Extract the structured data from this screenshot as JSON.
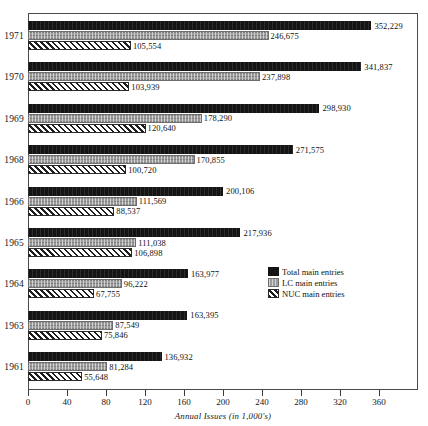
{
  "chart_data": {
    "type": "bar",
    "orientation": "horizontal",
    "title": "",
    "xlabel": "Annual Issues (in 1,000's)",
    "ylabel": "",
    "xlim": [
      0,
      400
    ],
    "xticks": [
      0,
      40,
      80,
      120,
      160,
      200,
      240,
      280,
      320,
      360
    ],
    "xtick_labels": [
      "0",
      "40",
      "80",
      "120",
      "160",
      "200",
      "240",
      "280",
      "320",
      "360"
    ],
    "grid": false,
    "legend_position": "inside-right",
    "units_note": "values plotted in 1,000's; data labels show full counts",
    "categories": [
      "1971",
      "1970",
      "1969",
      "1968",
      "1966",
      "1965",
      "1964",
      "1963",
      "1961"
    ],
    "series": [
      {
        "name": "Total main entries",
        "key": "total",
        "color": "#141414",
        "pattern": "solid-black",
        "values": [
          352229,
          341837,
          298930,
          271575,
          200106,
          217936,
          163977,
          163395,
          136932
        ],
        "labels": [
          "352,229",
          "341,837",
          "298,930",
          "271,575",
          "200,106",
          "217,936",
          "163,977",
          "163,395",
          "136,932"
        ]
      },
      {
        "name": "LC main entries",
        "key": "lc",
        "color": "#9c9c9c",
        "pattern": "gray-stipple",
        "values": [
          246675,
          237898,
          178290,
          170855,
          111569,
          111038,
          96222,
          87549,
          81284
        ],
        "labels": [
          "246,675",
          "237,898",
          "178,290",
          "170,855",
          "111,569",
          "111,038",
          "96,222",
          "87,549",
          "81,284"
        ]
      },
      {
        "name": "NUC main entries",
        "key": "nuc",
        "color": "#ffffff",
        "pattern": "diagonal-hatch",
        "values": [
          105554,
          103939,
          120640,
          100720,
          88537,
          106898,
          67755,
          75846,
          55648
        ],
        "labels": [
          "105,554",
          "103,939",
          "120,640",
          "100,720",
          "88,537",
          "106,898",
          "67,755",
          "75,846",
          "55,648"
        ]
      }
    ],
    "legend": [
      {
        "label": "Total main entries",
        "swatch": "total"
      },
      {
        "label": "LC main entries",
        "swatch": "lc"
      },
      {
        "label": "NUC main entries",
        "swatch": "nuc"
      }
    ]
  }
}
